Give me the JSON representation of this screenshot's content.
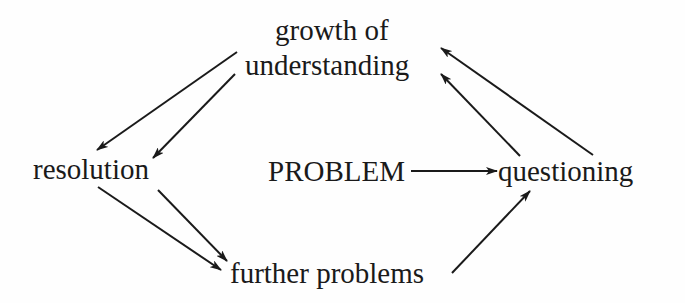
{
  "diagram": {
    "type": "concept-cycle",
    "nodes": {
      "growth_line1": "growth of",
      "growth_line2": "understanding",
      "resolution": "resolution",
      "problem": "PROBLEM",
      "questioning": "questioning",
      "further": "further problems"
    },
    "edges": [
      {
        "from": "growth of understanding",
        "to": "resolution"
      },
      {
        "from": "growth of understanding",
        "to": "resolution"
      },
      {
        "from": "resolution",
        "to": "further problems"
      },
      {
        "from": "resolution",
        "to": "further problems"
      },
      {
        "from": "PROBLEM",
        "to": "questioning"
      },
      {
        "from": "further problems",
        "to": "questioning"
      },
      {
        "from": "questioning",
        "to": "growth of understanding"
      },
      {
        "from": "questioning",
        "to": "growth of understanding"
      }
    ],
    "colors": {
      "ink": "#1a1a1a",
      "background": "#fefefe"
    }
  }
}
